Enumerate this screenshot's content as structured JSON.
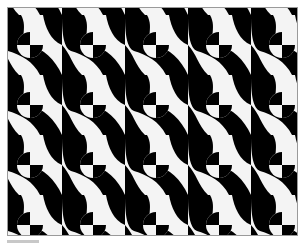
{
  "image": {
    "subject": "black-and-white geometric tessellation",
    "tile": {
      "width": 63,
      "height": 60
    },
    "circle_radius": 13,
    "colors": {
      "black": "#000000",
      "white": "#f4f4f4",
      "border": "#9a9a9a"
    },
    "circle_quadrants": [
      "black",
      "white",
      "white",
      "black"
    ]
  }
}
